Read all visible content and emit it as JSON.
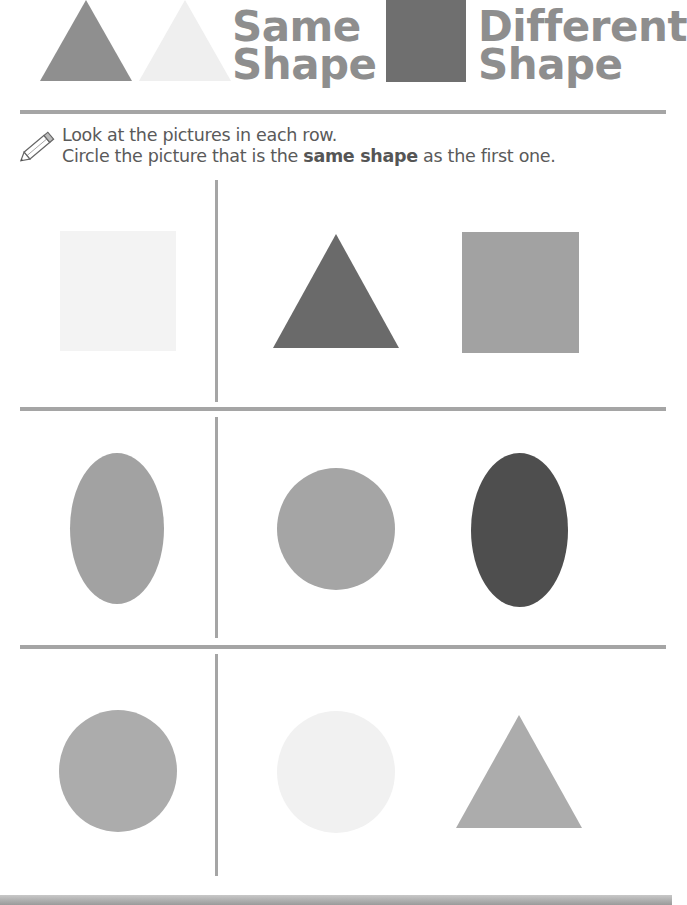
{
  "legend": {
    "same": {
      "line1": "Same",
      "line2": "Shape",
      "examples": [
        {
          "shape": "triangle",
          "color": "#8f8f8f"
        },
        {
          "shape": "triangle",
          "color": "#efefef"
        }
      ]
    },
    "different": {
      "line1": "Different",
      "line2": "Shape",
      "example": {
        "shape": "square",
        "color": "#6f6f6f"
      }
    }
  },
  "instructions": {
    "icon": "pencil-icon",
    "line1": "Look at the pictures in each row.",
    "line2_before": "Circle the picture that is the ",
    "line2_bold": "same shape",
    "line2_after": " as the first one."
  },
  "rows": [
    {
      "target": {
        "shape": "square",
        "color": "#f3f3f3"
      },
      "choices": [
        {
          "shape": "triangle",
          "color": "#6a6a6a"
        },
        {
          "shape": "square",
          "color": "#a2a2a2"
        }
      ]
    },
    {
      "target": {
        "shape": "oval",
        "color": "#a2a2a2"
      },
      "choices": [
        {
          "shape": "circle",
          "color": "#a5a5a5"
        },
        {
          "shape": "oval",
          "color": "#4e4e4e"
        }
      ]
    },
    {
      "target": {
        "shape": "circle",
        "color": "#acacac"
      },
      "choices": [
        {
          "shape": "circle",
          "color": "#f1f1f1"
        },
        {
          "shape": "triangle",
          "color": "#acacac"
        }
      ]
    }
  ],
  "colors": {
    "heading_text": "#8e8e8e",
    "divider": "#a5a5a5",
    "body_text": "#5a5a5a"
  }
}
